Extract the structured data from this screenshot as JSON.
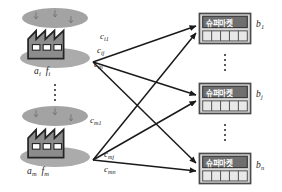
{
  "diagram": {
    "colors": {
      "arrow": "#1a1a1a",
      "factory_body": "#8c8c8c",
      "factory_outline": "#2b2b2b",
      "factory_window": "#ffffff",
      "ground_ellipse": "#a8a8a8",
      "cloud_ellipse": "#a0a0a0",
      "store_sign": "#6f6f6f",
      "store_body": "#d8d8d8",
      "store_outline": "#4a4a4a",
      "text": "#1a1a1a"
    },
    "sources": [
      {
        "id": "factory-i",
        "label_a": "a",
        "label_a_sub": "i",
        "label_f": "f",
        "label_f_sub": "i",
        "icon": "factory-icon"
      },
      {
        "id": "factory-m",
        "label_a": "a",
        "label_a_sub": "m",
        "label_f": "f",
        "label_f_sub": "m",
        "icon": "factory-icon"
      }
    ],
    "destinations": [
      {
        "id": "store-1",
        "sign_text": "슈퍼마켓",
        "label_b": "b",
        "label_b_sub": "1",
        "icon": "supermarket-icon"
      },
      {
        "id": "store-j",
        "sign_text": "슈퍼마켓",
        "label_b": "b",
        "label_b_sub": "j",
        "icon": "supermarket-icon"
      },
      {
        "id": "store-n",
        "sign_text": "슈퍼마켓",
        "label_b": "b",
        "label_b_sub": "n",
        "icon": "supermarket-icon"
      }
    ],
    "edges": [
      {
        "id": "edge-i1",
        "label_c": "c",
        "label_c_sub": "i1",
        "from": "factory-i",
        "to": "store-1"
      },
      {
        "id": "edge-ij",
        "label_c": "c",
        "label_c_sub": "ij",
        "from": "factory-i",
        "to": "store-j"
      },
      {
        "id": "edge-in",
        "label_c": "c",
        "label_c_sub": "in",
        "from": "factory-i",
        "to": "store-n"
      },
      {
        "id": "edge-m1",
        "label_c": "c",
        "label_c_sub": "m1",
        "from": "factory-m",
        "to": "store-1"
      },
      {
        "id": "edge-mj",
        "label_c": "c",
        "label_c_sub": "mj",
        "from": "factory-m",
        "to": "store-j"
      },
      {
        "id": "edge-mn",
        "label_c": "c",
        "label_c_sub": "mn",
        "from": "factory-m",
        "to": "store-n"
      }
    ],
    "ellipsis": {
      "sources_symbol": "vertical-dots",
      "destinations_symbol": "vertical-dots"
    }
  }
}
